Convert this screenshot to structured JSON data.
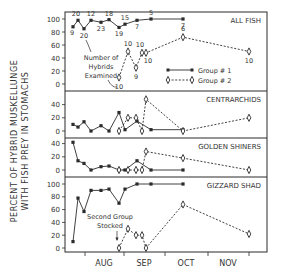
{
  "chart_data": {
    "type": "line",
    "ylabel": "PERCENT OF HYBRID MUSKELLUNGE WITH FISH PREY IN STOMACHS",
    "ylabel_lines": [
      "PERCENT  OF  HYBRID MUSKELLUNGE",
      "WITH FISH  PREY  IN  STOMACHS"
    ],
    "xlabel": "",
    "x_months": [
      "AUG",
      "SEP",
      "OCT",
      "NOV"
    ],
    "legend": [
      {
        "name": "Group # 1",
        "style": "solid",
        "marker": "filled-square"
      },
      {
        "name": "Group # 2",
        "style": "dashed",
        "marker": "open-diamond"
      }
    ],
    "legend_position": "inside top-right of ALL FISH panel",
    "panels": [
      {
        "title": "ALL FISH",
        "ylim": [
          0,
          100
        ],
        "yticks": [
          0,
          20,
          40,
          60,
          80,
          100
        ],
        "series": [
          {
            "name": "Group # 1",
            "x": [
              73,
              78,
              84,
              91,
              101,
              109,
              119,
              125,
              137,
              151,
              183
            ],
            "values": [
              88,
              98,
              85,
              98,
              95,
              99,
              87,
              92,
              98,
              100,
              100
            ],
            "n_labels": [
              "9",
              "20",
              "20",
              "12",
              "23",
              "18",
              "19",
              "15",
              "7",
              "5",
              "7"
            ]
          },
          {
            "name": "Group # 2",
            "x": [
              119,
              128,
              136,
              142,
              146,
              183,
              249
            ],
            "values": [
              10,
              50,
              25,
              48,
              48,
              72,
              50
            ],
            "n_labels": [
              "10",
              "10",
              "9",
              "10",
              "10",
              "6",
              "10"
            ]
          }
        ],
        "annotation": "Number of Hybrids Examined"
      },
      {
        "title": "CENTRARCHIDS",
        "ylim": [
          0,
          50
        ],
        "yticks": [
          0,
          20,
          40
        ],
        "series": [
          {
            "name": "Group # 1",
            "x": [
              73,
              78,
              84,
              91,
              101,
              109,
              119,
              125,
              137,
              151,
              183
            ],
            "values": [
              10,
              6,
              14,
              0,
              8,
              0,
              28,
              2,
              15,
              2,
              2
            ]
          },
          {
            "name": "Group # 2",
            "x": [
              119,
              128,
              136,
              142,
              146,
              183,
              249
            ],
            "values": [
              0,
              20,
              20,
              0,
              48,
              0,
              20
            ]
          }
        ]
      },
      {
        "title": "GOLDEN SHINERS",
        "ylim": [
          0,
          50
        ],
        "yticks": [
          0,
          20,
          40
        ],
        "series": [
          {
            "name": "Group # 1",
            "x": [
              73,
              78,
              84,
              91,
              101,
              109,
              119,
              125,
              137,
              151,
              183
            ],
            "values": [
              42,
              14,
              10,
              0,
              5,
              6,
              0,
              0,
              14,
              0,
              0
            ]
          },
          {
            "name": "Group # 2",
            "x": [
              119,
              128,
              136,
              142,
              146,
              183,
              249
            ],
            "values": [
              0,
              0,
              0,
              0,
              28,
              18,
              0
            ]
          }
        ]
      },
      {
        "title": "GIZZARD SHAD",
        "ylim": [
          0,
          100
        ],
        "yticks": [
          0,
          20,
          40,
          60,
          80,
          100
        ],
        "series": [
          {
            "name": "Group # 1",
            "x": [
              73,
              78,
              84,
              91,
              101,
              109,
              119,
              125,
              137,
              151,
              183
            ],
            "values": [
              10,
              78,
              57,
              90,
              90,
              92,
              70,
              92,
              100,
              100,
              100
            ]
          },
          {
            "name": "Group # 2",
            "x": [
              119,
              128,
              136,
              142,
              146,
              183,
              249
            ],
            "values": [
              0,
              30,
              20,
              20,
              0,
              68,
              22
            ]
          }
        ],
        "annotation": "Second Group Stocked"
      }
    ]
  },
  "labels": {
    "ylabel_line1": "PERCENT  OF  HYBRID MUSKELLUNGE",
    "ylabel_line2": "WITH FISH  PREY  IN  STOMACHS",
    "annotation_hybrids": [
      "Number of",
      "Hybrids",
      "Examined"
    ],
    "annotation_stocked": [
      "Second Group",
      "Stocked"
    ]
  }
}
